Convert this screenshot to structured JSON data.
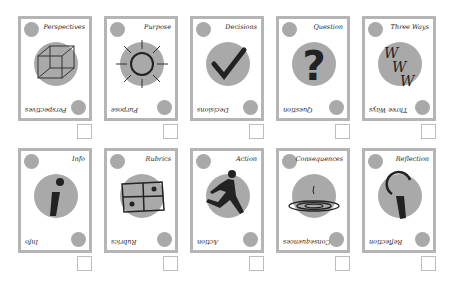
{
  "cards": [
    {
      "title": "Perspectives",
      "icon": "cube-icon"
    },
    {
      "title": "Purpose",
      "icon": "sun-icon"
    },
    {
      "title": "Decisions",
      "icon": "checkmark-icon"
    },
    {
      "title": "Question",
      "icon": "question-mark-icon"
    },
    {
      "title": "Three Ways",
      "icon": "www-icon"
    },
    {
      "title": "Info",
      "icon": "info-icon"
    },
    {
      "title": "Rubrics",
      "icon": "rubric-grid-icon"
    },
    {
      "title": "Action",
      "icon": "runner-icon"
    },
    {
      "title": "Consequences",
      "icon": "ripple-icon"
    },
    {
      "title": "Reflection",
      "icon": "magnifier-icon"
    }
  ],
  "colors": {
    "card_border": "#b5b5b5",
    "circle": "#a9a9a9",
    "ink": "#222222"
  }
}
